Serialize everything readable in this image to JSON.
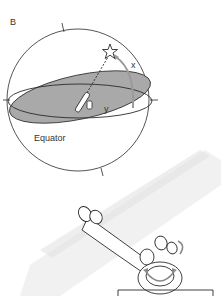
{
  "panel": {
    "label": "B"
  },
  "sphere": {
    "labels": {
      "equator": "Equator",
      "arc_x": "x",
      "arc_y": "y"
    },
    "star_icon": "star-outline",
    "plane_fill": "#a9a9a9"
  },
  "mount": {
    "description": "equatorial telescope mount with rotation arrows",
    "arrow_color": "#9a9a9a"
  },
  "colors": {
    "line": "#2a2a2a",
    "background": "#ffffff",
    "shadow": "#e6e6e6"
  }
}
